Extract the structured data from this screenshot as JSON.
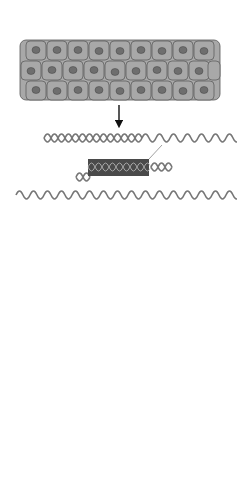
{
  "diagram": {
    "title_label": "Human bladder carcinoma",
    "dna_label": "DNA",
    "oncogene_label_1": "Oncogene",
    "oncogene_label_2": "Oncogene",
    "recipient_label_line1": "Recipient",
    "recipient_label_line2": "mouse cells",
    "oncogene_human_line1": "Oncogene",
    "oncogene_human_line2": "from human",
    "oncogene_human_line3": "bladder",
    "oncogene_human_line4": "carcinoma",
    "transformed_label_line1": "Transformed",
    "transformed_label_line2": "mouse cells"
  },
  "colors": {
    "cell_fill": "#a8a8a8",
    "nucleus_fill": "#6e6e6e",
    "oncogene_block": "#4a4a4a",
    "mouse_cell_fill": "#c8c8c8",
    "transformed_fill": "#888888"
  }
}
